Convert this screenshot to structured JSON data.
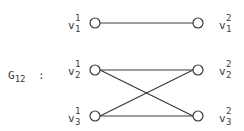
{
  "graph": {
    "name": "G",
    "name_subscript": "12",
    "separator": ":",
    "left_vertices": [
      {
        "base": "v",
        "sup": "1",
        "sub": "1"
      },
      {
        "base": "v",
        "sup": "1",
        "sub": "2"
      },
      {
        "base": "v",
        "sup": "1",
        "sub": "3"
      }
    ],
    "right_vertices": [
      {
        "base": "v",
        "sup": "2",
        "sub": "1"
      },
      {
        "base": "v",
        "sup": "2",
        "sub": "2"
      },
      {
        "base": "v",
        "sup": "2",
        "sub": "3"
      }
    ],
    "edges": [
      [
        "v1^1",
        "v1^2"
      ],
      [
        "v2^1",
        "v2^2"
      ],
      [
        "v2^1",
        "v3^2"
      ],
      [
        "v3^1",
        "v2^2"
      ],
      [
        "v3^1",
        "v3^2"
      ]
    ],
    "stroke_color": "#3a3a3a"
  }
}
